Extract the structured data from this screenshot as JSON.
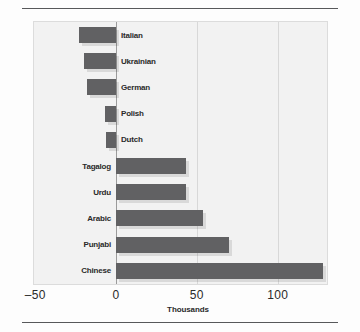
{
  "page": {
    "title_sliver": "",
    "background": "#fdfdfd",
    "rule_color": "#57585a"
  },
  "chart_data": {
    "type": "bar",
    "orientation": "horizontal",
    "title": "",
    "xlabel": "Thousands",
    "ylabel": "",
    "categories": [
      "Italian",
      "Ukrainian",
      "German",
      "Polish",
      "Dutch",
      "Tagalog",
      "Urdu",
      "Arabic",
      "Punjabi",
      "Chinese"
    ],
    "values": [
      -23,
      -20,
      -18,
      -7,
      -6,
      43,
      43,
      54,
      70,
      128
    ],
    "xlim": [
      -55,
      132
    ],
    "xticks": [
      -50,
      0,
      50,
      100
    ],
    "xticklabels": [
      "–50",
      "0",
      "50",
      "100"
    ],
    "gridlines": [
      50,
      100
    ],
    "zero_line": 0,
    "grid": true,
    "legend": null,
    "bar_color": "#616163",
    "plot_background": "#f2f2f2",
    "plot_border_color": "#dcdcdc"
  },
  "axis": {
    "tick_labels": [
      "–50",
      "0",
      "50",
      "100"
    ],
    "axis_title": "Thousands"
  }
}
